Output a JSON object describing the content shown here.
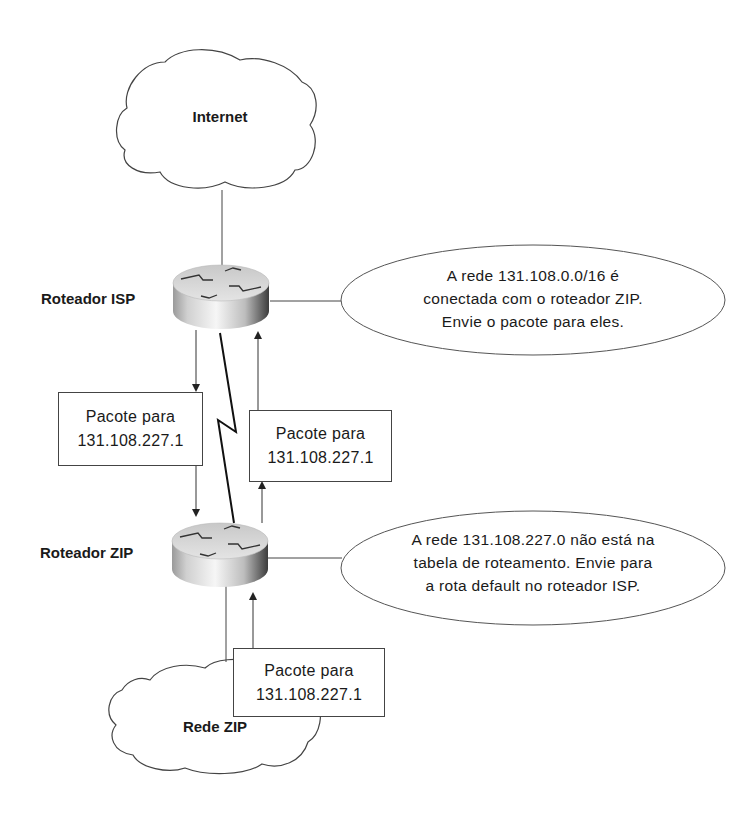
{
  "nodes": {
    "internet": {
      "label": "Internet"
    },
    "rede_zip": {
      "label": "Rede ZIP"
    },
    "router_isp": {
      "label": "Roteador ISP"
    },
    "router_zip": {
      "label": "Roteador ZIP"
    }
  },
  "packets": [
    {
      "line1": "Pacote para",
      "line2": "131.108.227.1"
    },
    {
      "line1": "Pacote para",
      "line2": "131.108.227.1"
    },
    {
      "line1": "Pacote para",
      "line2": "131.108.227.1"
    }
  ],
  "callouts": {
    "isp": {
      "line1": "A rede 131.108.0.0/16 é",
      "line2": "conectada com o roteador ZIP.",
      "line3": "Envie o pacote para eles."
    },
    "zip": {
      "line1": "A rede 131.108.227.0 não está na",
      "line2": "tabela de roteamento. Envie para",
      "line3": "a rota default no roteador ISP."
    }
  },
  "colors": {
    "line": "#333333",
    "router_top": "#d8d8d8",
    "router_side_dark": "#555555",
    "router_side_light": "#f4f4f4"
  }
}
